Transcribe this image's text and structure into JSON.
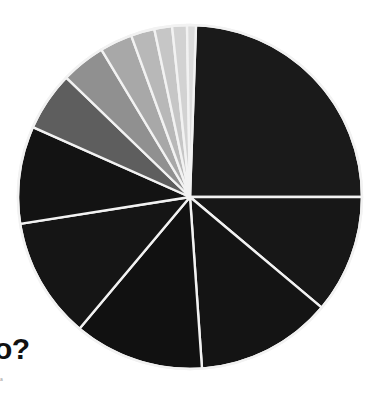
{
  "figure": {
    "headline": "o?",
    "subcaption": "a",
    "background_color": "#ffffff",
    "separator_color": "#f2f2f2"
  },
  "chart_data": {
    "type": "pie",
    "title": "o?",
    "subtitle": "a",
    "center_x": 190,
    "center_y": 197,
    "radius": 172,
    "start_angle_deg": 2,
    "direction": "clockwise",
    "grid": false,
    "legend": "none",
    "labels": [
      "Slice 1",
      "Slice 2",
      "Slice 3",
      "Slice 4",
      "Slice 5",
      "Slice 6",
      "Slice 7",
      "Slice 8",
      "Slice 9",
      "Slice 10",
      "Slice 11",
      "Slice 12",
      "Slice 13"
    ],
    "values": [
      24.4,
      11.1,
      12.8,
      12.2,
      11.4,
      9.2,
      5.6,
      4.2,
      3.1,
      2.2,
      1.7,
      1.4,
      0.7
    ],
    "angles_deg": [
      88,
      40,
      46,
      44,
      41,
      33,
      20,
      15,
      11,
      8,
      6,
      5,
      3
    ],
    "colors": [
      "#1a1a1a",
      "#171717",
      "#141414",
      "#111111",
      "#151515",
      "#131313",
      "#5e5e5e",
      "#909090",
      "#a8a8a8",
      "#b8b8b8",
      "#c6c6c6",
      "#d2d2d2",
      "#dcdcdc"
    ]
  }
}
